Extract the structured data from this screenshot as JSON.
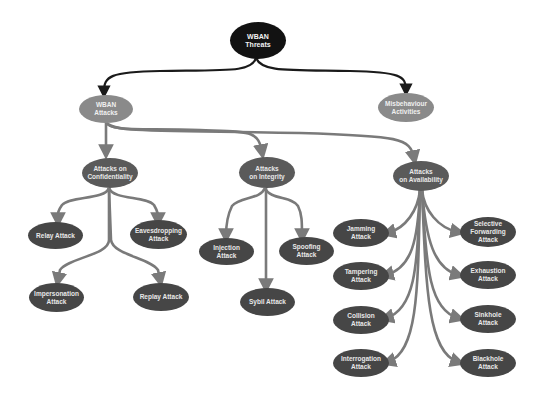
{
  "diagram": {
    "title": "WBAN Threats",
    "colors": {
      "root": "#121212",
      "level1": "#8a8a8a",
      "level2": "#5a5a5a",
      "leaf": "#464646",
      "root_edges": "#1a1a1a",
      "edges": "#7a7a7a"
    },
    "nodes": {
      "root": {
        "label": "WBAN Threats"
      },
      "wban_attacks": {
        "label": "WBAN\nAttacks"
      },
      "misbehaviour": {
        "label": "Misbehaviour\nActivities"
      },
      "confidentiality": {
        "label": "Attacks on\nConfidentiality"
      },
      "integrity": {
        "label": "Attacks\non Integrity"
      },
      "availability": {
        "label": "Attacks\non Availability"
      },
      "relay": {
        "label": "Relay Attack"
      },
      "eavesdropping": {
        "label": "Eavesdropping\nAttack"
      },
      "impersonation": {
        "label": "Impersonation\nAttack"
      },
      "replay": {
        "label": "Replay Attack"
      },
      "injection": {
        "label": "Injection Attack"
      },
      "spoofing": {
        "label": "Spoofing Attack"
      },
      "sybil": {
        "label": "Sybil Attack"
      },
      "jamming": {
        "label": "Jamming Attack"
      },
      "tampering": {
        "label": "Tampering\nAttack"
      },
      "collision": {
        "label": "Collision Attack"
      },
      "interrogation": {
        "label": "Interrogation\nAttack"
      },
      "selective_forwarding": {
        "label": "Selective\nForwarding\nAttack"
      },
      "exhaustion": {
        "label": "Exhaustion\nAttack"
      },
      "sinkhole": {
        "label": "Sinkhole Attack"
      },
      "blackhole": {
        "label": "Blackhole Attack"
      }
    },
    "edges": [
      [
        "root",
        "wban_attacks"
      ],
      [
        "root",
        "misbehaviour"
      ],
      [
        "wban_attacks",
        "confidentiality"
      ],
      [
        "wban_attacks",
        "integrity"
      ],
      [
        "wban_attacks",
        "availability"
      ],
      [
        "confidentiality",
        "relay"
      ],
      [
        "confidentiality",
        "eavesdropping"
      ],
      [
        "confidentiality",
        "impersonation"
      ],
      [
        "confidentiality",
        "replay"
      ],
      [
        "integrity",
        "injection"
      ],
      [
        "integrity",
        "spoofing"
      ],
      [
        "integrity",
        "sybil"
      ],
      [
        "availability",
        "jamming"
      ],
      [
        "availability",
        "tampering"
      ],
      [
        "availability",
        "collision"
      ],
      [
        "availability",
        "interrogation"
      ],
      [
        "availability",
        "selective_forwarding"
      ],
      [
        "availability",
        "exhaustion"
      ],
      [
        "availability",
        "sinkhole"
      ],
      [
        "availability",
        "blackhole"
      ]
    ]
  }
}
